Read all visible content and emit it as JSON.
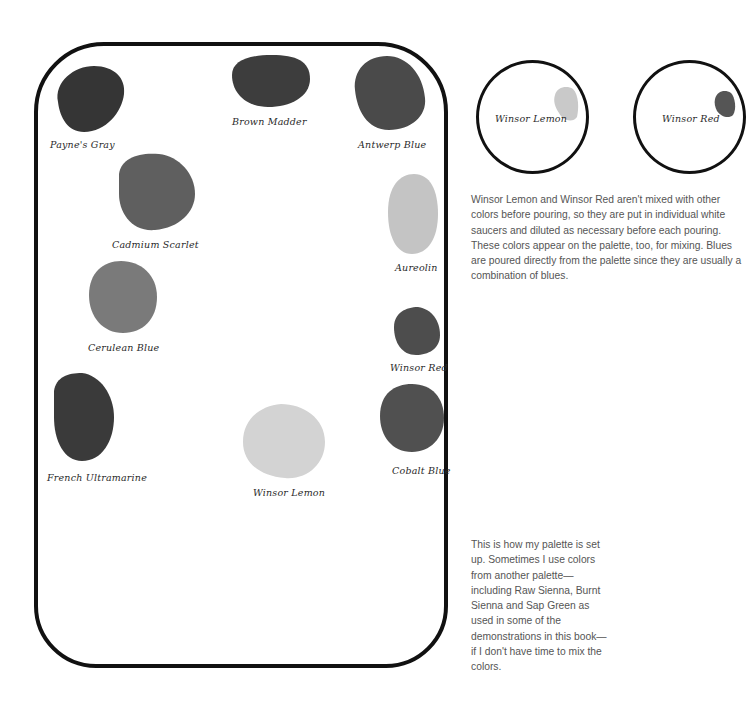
{
  "palette": {
    "wells": [
      {
        "name": "Payne's Gray",
        "color": "#353535"
      },
      {
        "name": "Brown Madder",
        "color": "#3d3d3d"
      },
      {
        "name": "Antwerp Blue",
        "color": "#4a4a4a"
      },
      {
        "name": "Cadmium Scarlet",
        "color": "#5f5f5f"
      },
      {
        "name": "Aureolin",
        "color": "#c4c4c4"
      },
      {
        "name": "Cerulean Blue",
        "color": "#7a7a7a"
      },
      {
        "name": "Winsor Red",
        "color": "#4d4d4d"
      },
      {
        "name": "French Ultramarine",
        "color": "#3a3a3a"
      },
      {
        "name": "Winsor Lemon",
        "color": "#d3d3d3"
      },
      {
        "name": "Cobalt Blue",
        "color": "#505050"
      }
    ]
  },
  "saucers": [
    {
      "name": "Winsor Lemon",
      "color": "#c9c9c9"
    },
    {
      "name": "Winsor Red",
      "color": "#555555"
    }
  ],
  "captions": {
    "saucers": "Winsor Lemon and Winsor Red aren't mixed with other colors before pouring, so they are put in individual white saucers and diluted as necessary before each pouring. These colors appear on the palette, too, for mixing. Blues are poured directly from the palette since they are usually a combination of blues.",
    "palette": "This is how my palette is set up. Sometimes I use colors from another palette—including Raw Sienna, Burnt Sienna and Sap Green as used in some of the demonstrations in this book—if I don't have time to mix the colors."
  }
}
